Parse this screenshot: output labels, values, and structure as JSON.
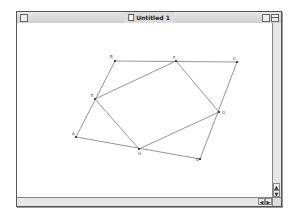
{
  "window": {
    "title": "Untitled 1",
    "icons": {
      "close": "close-box-icon",
      "zoom": "zoom-box-icon",
      "collapse": "collapse-box-icon",
      "document": "document-icon"
    }
  },
  "scrollbars": {
    "vertical": {
      "up": "▲",
      "down": "▼"
    },
    "horizontal": {
      "left": "◀",
      "right": "▶"
    }
  },
  "figure": {
    "points": [
      {
        "label": "A",
        "x": 76,
        "y": 137
      },
      {
        "label": "B",
        "x": 115,
        "y": 61
      },
      {
        "label": "C",
        "x": 237,
        "y": 62
      },
      {
        "label": "D",
        "x": 200,
        "y": 159
      },
      {
        "label": "E",
        "x": 95,
        "y": 99
      },
      {
        "label": "F",
        "x": 176,
        "y": 61
      },
      {
        "label": "G",
        "x": 219,
        "y": 112
      },
      {
        "label": "H",
        "x": 139,
        "y": 149
      }
    ],
    "outer_quadrilateral": [
      "A",
      "B",
      "C",
      "D"
    ],
    "inner_quadrilateral": [
      "E",
      "F",
      "G",
      "H"
    ],
    "line_color": "#7a7a7a"
  }
}
